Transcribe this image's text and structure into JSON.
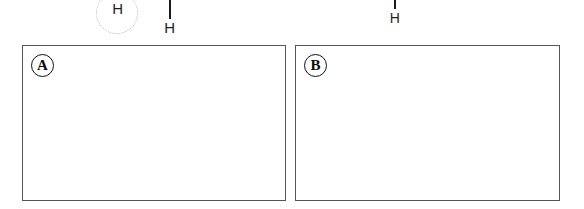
{
  "figure": {
    "background_color": "#ffffff",
    "width": 584,
    "height": 209
  },
  "annotations": [
    {
      "id": "circled-hydrogen",
      "atom_label": "H",
      "style": "dotted-circle-highlight",
      "circle_color": "#b9b9b9",
      "text_color": "#1f1f1f",
      "has_bond": false
    },
    {
      "id": "hydrogen-with-long-bond",
      "atom_label": "H",
      "style": "vertical-bond-above",
      "bond_color": "#1a1a1a",
      "text_color": "#1f1f1f",
      "has_bond": true
    },
    {
      "id": "hydrogen-with-short-bond",
      "atom_label": "H",
      "style": "vertical-bond-above",
      "bond_color": "#1a1a1a",
      "text_color": "#1f1f1f",
      "has_bond": true
    }
  ],
  "panels": [
    {
      "id": "panel-a",
      "label": "A",
      "border_color": "#555555",
      "fill_color": "#ffffff",
      "content": ""
    },
    {
      "id": "panel-b",
      "label": "B",
      "border_color": "#555555",
      "fill_color": "#ffffff",
      "content": ""
    }
  ]
}
